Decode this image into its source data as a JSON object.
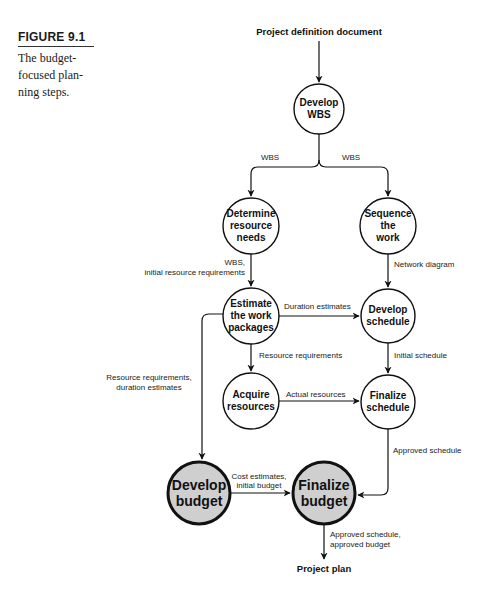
{
  "caption": {
    "label": "FIGURE 9.1",
    "text_lines": [
      "The budget-",
      "focused plan-",
      "ning steps."
    ]
  },
  "diagram": {
    "input": "Project definition document",
    "output": "Project plan",
    "colors": {
      "line": "#111111",
      "node_fill": "#ffffff",
      "highlight_fill": "#cfcfcf"
    },
    "nodes": {
      "develop_wbs": [
        "Develop",
        "WBS"
      ],
      "determine_resources": [
        "Determine",
        "resource",
        "needs"
      ],
      "sequence_work": [
        "Sequence",
        "the",
        "work"
      ],
      "estimate_work": [
        "Estimate",
        "the work",
        "packages"
      ],
      "develop_schedule": [
        "Develop",
        "schedule"
      ],
      "acquire_resources": [
        "Acquire",
        "resources"
      ],
      "finalize_schedule": [
        "Finalize",
        "schedule"
      ],
      "develop_budget": [
        "Develop",
        "budget"
      ],
      "finalize_budget": [
        "Finalize",
        "budget"
      ]
    },
    "edges": {
      "wbs_left": "WBS",
      "wbs_right": "WBS",
      "wbs_initial": [
        "WBS,",
        "initial resource requirements"
      ],
      "network_diagram": "Network diagram",
      "duration_estimates": "Duration estimates",
      "resource_requirements": "Resource requirements",
      "initial_schedule": "Initial schedule",
      "resource_duration": [
        "Resource requirements,",
        "duration estimates"
      ],
      "actual_resources": "Actual resources",
      "approved_schedule": "Approved schedule",
      "cost_estimates": [
        "Cost estimates,",
        "initial budget"
      ],
      "approved_final": [
        "Approved schedule,",
        "approved budget"
      ]
    }
  }
}
